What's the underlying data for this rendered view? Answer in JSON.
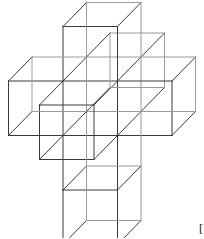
{
  "figure": {
    "projection": {
      "origin_x": 63,
      "origin_y": 81,
      "edge": 54.5,
      "depth_dx": 23.5,
      "depth_dy": -24
    },
    "stroke": {
      "front": "#3a3a3a",
      "back": "#9a9a9a",
      "width": 1
    },
    "cubes": [
      {
        "name": "center-cube",
        "x": 0,
        "y": 0,
        "z": 0
      },
      {
        "name": "front-cube",
        "x": 0,
        "y": 0,
        "z": -1
      },
      {
        "name": "back-cube",
        "x": 0,
        "y": 0,
        "z": 1
      },
      {
        "name": "top-cube",
        "x": 0,
        "y": -1,
        "z": 0
      },
      {
        "name": "left-cube",
        "x": -1,
        "y": 0,
        "z": 0
      },
      {
        "name": "right-cube",
        "x": 1,
        "y": 0,
        "z": 0
      },
      {
        "name": "lower-cube",
        "x": 0,
        "y": 1,
        "z": 0
      },
      {
        "name": "bottom-cube",
        "x": 0,
        "y": 2,
        "z": 0
      }
    ]
  },
  "caption_fragment": {
    "lines": [
      "[",
      "4",
      "p"
    ]
  }
}
